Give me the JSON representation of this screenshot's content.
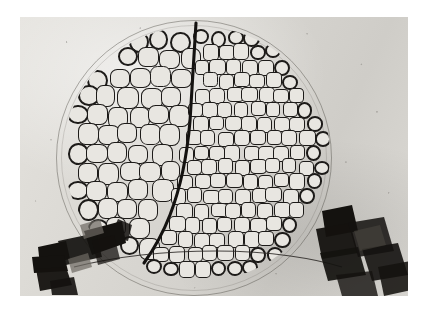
{
  "photograph": {
    "title": "Two-domain bubble raft in a circular dish",
    "medium": "black-and-white photographic print",
    "border_color": "#ffffff",
    "print_tone": "#d9d7d2",
    "ink_color": "#1d1b19"
  },
  "scene": {
    "apparatus_label": "circular dish with bubble raft",
    "dish": {
      "shape": "circle",
      "center_x": 174,
      "center_y": 141,
      "radius": 138,
      "rim_color": "#46423c"
    },
    "domains": [
      {
        "name": "left-domain",
        "description": "coarse bubbles, larger cells",
        "mean_cell_diameter_px": 21,
        "cell_count": 86,
        "cell_fill": "#e8e6e1"
      },
      {
        "name": "right-domain",
        "description": "fine bubbles, smaller hexagonal cells",
        "mean_cell_diameter_px": 16,
        "cell_count": 118,
        "cell_fill": "#e8e6e1"
      }
    ],
    "grain_boundary": {
      "name": "domain-boundary",
      "description": "heavy dark line separating the coarse and fine bubble domains; vertical at top, curving to the lower left",
      "stroke_color": "#141210",
      "stroke_width": 3
    },
    "clamps": [
      {
        "name": "left-clamp",
        "position": "bottom-left",
        "color": "#14120f"
      },
      {
        "name": "right-clamp",
        "position": "bottom-right",
        "color": "#14120f"
      }
    ],
    "frame_wire": {
      "name": "frame-wire",
      "description": "thin dark wire of the frame crossing the lower part of the dish",
      "color": "#2a2724"
    }
  }
}
